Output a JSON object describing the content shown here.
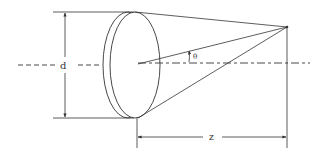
{
  "diagram": {
    "labels": {
      "diameter": "d",
      "distance": "z",
      "angle": "θ"
    },
    "colors": {
      "line": "#333333",
      "background": "#ffffff"
    }
  }
}
